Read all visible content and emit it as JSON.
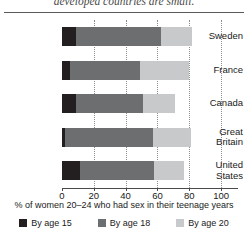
{
  "caption": "developed countries are small.",
  "chart_data": {
    "type": "bar",
    "orientation": "horizontal",
    "stacked": false,
    "overlapping": true,
    "title": "",
    "xlabel": "% of women 20–24 who had sex in their teenage years",
    "ylabel": "",
    "xlim": [
      0,
      110
    ],
    "xticks": [
      0,
      20,
      40,
      60,
      80,
      100
    ],
    "xtick_labels": [
      "0",
      "20",
      "40",
      "60",
      "80",
      "100"
    ],
    "grid": "vertical-dotted",
    "legend_position": "bottom",
    "categories": [
      "Sweden",
      "France",
      "Canada",
      "Great Britain",
      "United States"
    ],
    "series": [
      {
        "name": "By age 15",
        "color": "#231f20",
        "values": [
          9,
          5,
          9,
          2,
          11
        ]
      },
      {
        "name": "By age 18",
        "color": "#6d6e70",
        "values": [
          62,
          49,
          51,
          57,
          58
        ]
      },
      {
        "name": "By age 20",
        "color": "#c8c9ca",
        "values": [
          82,
          80,
          71,
          81,
          77
        ]
      }
    ]
  },
  "legend": {
    "items": [
      {
        "label": "By age 15",
        "color": "#231f20"
      },
      {
        "label": "By age 18",
        "color": "#6d6e70"
      },
      {
        "label": "By age 20",
        "color": "#c8c9ca"
      }
    ]
  }
}
